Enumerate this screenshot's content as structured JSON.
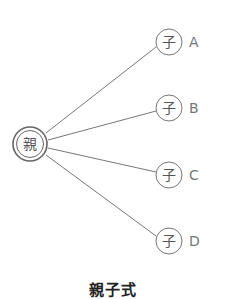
{
  "diagram": {
    "parent": {
      "label": "親",
      "cx": 30,
      "cy": 144
    },
    "children": [
      {
        "symbol": "子",
        "label": "A",
        "cx": 169,
        "cy": 42
      },
      {
        "symbol": "子",
        "label": "B",
        "cx": 169,
        "cy": 108
      },
      {
        "symbol": "子",
        "label": "C",
        "cx": 169,
        "cy": 175
      },
      {
        "symbol": "子",
        "label": "D",
        "cx": 169,
        "cy": 241
      }
    ],
    "caption": "親子式",
    "colors": {
      "line": "#777777",
      "stroke": "#666666",
      "text": "#555555"
    }
  }
}
